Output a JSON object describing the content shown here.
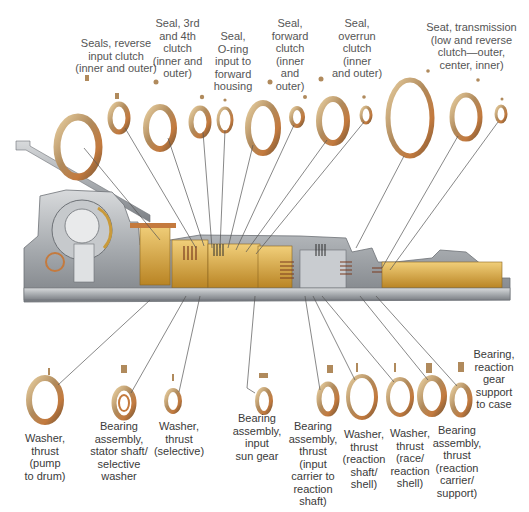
{
  "figure": {
    "colors": {
      "ring_bronze": "#b08a5c",
      "ring_copper": "#c47a3e",
      "ring_highlight": "#e8cfa0",
      "housing_gray": "#a9adb1",
      "internal_gold": "#d9a640",
      "leader_line": "#555555",
      "label_text": "#3a3a3a"
    }
  },
  "labels_top": [
    {
      "id": "seals-reverse-input-clutch",
      "text": "Seals, reverse\ninput clutch\n(inner and outer)"
    },
    {
      "id": "seal-3rd-4th-clutch",
      "text": "Seal, 3rd\nand 4th\nclutch\n(inner and\nouter)"
    },
    {
      "id": "seal-oring-input-forward-housing",
      "text": "Seal,\nO-ring\ninput to\nforward\nhousing"
    },
    {
      "id": "seal-forward-clutch",
      "text": "Seal,\nforward\nclutch\n(inner\nand\nouter)"
    },
    {
      "id": "seal-overrun-clutch",
      "text": "Seal,\noverrun\nclutch\n(inner\nand outer)"
    },
    {
      "id": "seat-transmission-low-reverse",
      "text": "Seat, transmission\n(low and reverse\nclutch—outer,\ncenter, inner)"
    }
  ],
  "labels_bottom": [
    {
      "id": "washer-thrust-pump-to-drum",
      "text": "Washer,\nthrust\n(pump\nto drum)"
    },
    {
      "id": "bearing-stator-shaft-selective-washer",
      "text": "Bearing\nassembly,\nstator shaft/\nselective\nwasher"
    },
    {
      "id": "washer-thrust-selective",
      "text": "Washer,\nthrust\n(selective)"
    },
    {
      "id": "bearing-input-sun-gear",
      "text": "Bearing\nassembly,\ninput\nsun gear"
    },
    {
      "id": "bearing-thrust-input-carrier-reaction-shaft",
      "text": "Bearing\nassembly,\nthrust\n(input\ncarrier to\nreaction\nshaft)"
    },
    {
      "id": "washer-thrust-reaction-shaft-shell",
      "text": "Washer,\nthrust\n(reaction\nshaft/\nshell)"
    },
    {
      "id": "washer-thrust-race-reaction-shell",
      "text": "Washer,\nthrust\n(race/\nreaction\nshell)"
    },
    {
      "id": "bearing-thrust-reaction-carrier-support",
      "text": "Bearing\nassembly,\nthrust\n(reaction\ncarrier/\nsupport)"
    },
    {
      "id": "bearing-reaction-gear-support-to-case",
      "text": "Bearing,\nreaction\ngear\nsupport\nto case"
    }
  ]
}
